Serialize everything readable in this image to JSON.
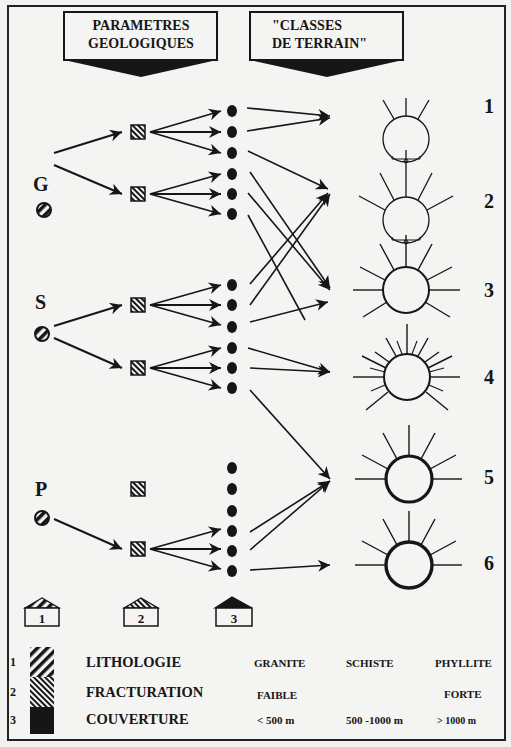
{
  "headers": {
    "left": {
      "line1": "PARAMETRES",
      "line2": "GEOLOGIQUES"
    },
    "right": {
      "line1": "\"CLASSES",
      "line2": "DE TERRAIN\""
    }
  },
  "rock_types": [
    {
      "label": "G",
      "y": 183
    },
    {
      "label": "S",
      "y": 332
    },
    {
      "label": "P",
      "y": 515
    }
  ],
  "terrain_classes": [
    {
      "label": "1",
      "y": 132,
      "rays": 3,
      "ring": "thin"
    },
    {
      "label": "2",
      "y": 216,
      "rays": 5,
      "ring": "thin"
    },
    {
      "label": "3",
      "y": 300,
      "rays": 8,
      "ring": "medium"
    },
    {
      "label": "4",
      "y": 384,
      "rays": 16,
      "ring": "medium"
    },
    {
      "label": "5",
      "y": 477,
      "rays": 8,
      "ring": "thick"
    },
    {
      "label": "6",
      "y": 562,
      "rays": 8,
      "ring": "thick"
    }
  ],
  "parameter_houses": [
    {
      "label": "1",
      "fill": "stripes-back"
    },
    {
      "label": "2",
      "fill": "stripes-fine"
    },
    {
      "label": "3",
      "fill": "solid"
    }
  ],
  "legend": {
    "rows": [
      {
        "num": "1",
        "name": "LITHOLOGIE",
        "col1": "GRANITE",
        "col2": "SCHISTE",
        "col3": "PHYLLITE"
      },
      {
        "num": "2",
        "name": "FRACTURATION",
        "col1": "FAIBLE",
        "col2": "",
        "col3": "FORTE"
      },
      {
        "num": "3",
        "name": "COUVERTURE",
        "col1": "< 500 m",
        "col2": "500 -1000 m",
        "col3": "> 1000 m"
      }
    ]
  },
  "colors": {
    "ink": "#161616",
    "paper": "#f4f4f2"
  }
}
